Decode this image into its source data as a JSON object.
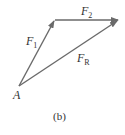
{
  "diagram": {
    "type": "vector-triangle",
    "vectors": [
      {
        "name": "F1",
        "label": "F",
        "sub": "1",
        "from": "A",
        "to": "tip1"
      },
      {
        "name": "F2",
        "label": "F",
        "sub": "2",
        "from": "tip1",
        "to": "tip2"
      },
      {
        "name": "FR",
        "label": "F",
        "sub": "R",
        "from": "A",
        "to": "tip2"
      }
    ],
    "point_label": "A",
    "caption": "(b)",
    "colors": {
      "arrow": "#6a6a6a",
      "text": "#333333"
    }
  }
}
